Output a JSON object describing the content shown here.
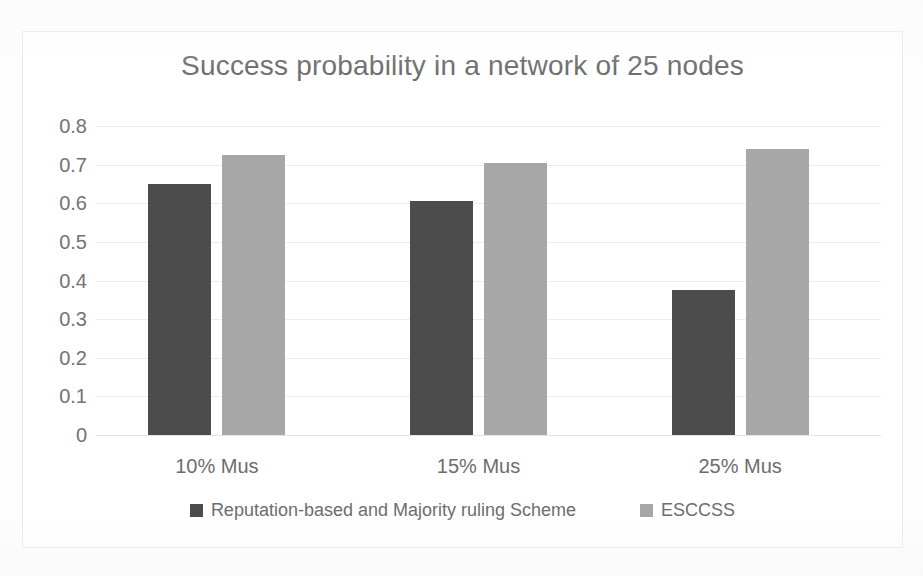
{
  "chart_data": {
    "type": "bar",
    "title": "Success probability in a network of 25 nodes",
    "xlabel": "",
    "ylabel": "",
    "categories": [
      "10% Mus",
      "15% Mus",
      "25% Mus"
    ],
    "series": [
      {
        "name": "Reputation-based and Majority ruling Scheme",
        "color": "#4c4c4c",
        "values": [
          0.65,
          0.605,
          0.375
        ]
      },
      {
        "name": "ESCCSS",
        "color": "#a7a7a7",
        "values": [
          0.725,
          0.705,
          0.74
        ]
      }
    ],
    "ylim": [
      0,
      0.8
    ],
    "yticks": [
      0,
      0.1,
      0.2,
      0.3,
      0.4,
      0.5,
      0.6,
      0.7,
      0.8
    ],
    "ytick_labels": [
      "0",
      "0.1",
      "0.2",
      "0.3",
      "0.4",
      "0.5",
      "0.6",
      "0.7",
      "0.8"
    ],
    "grid": true,
    "legend_position": "bottom"
  },
  "colors": {
    "series_dark": "#4c4c4c",
    "series_light": "#a7a7a7",
    "title_text": "#6f6f6f",
    "axis_text": "#6d6d6d",
    "gridline": "#ededed",
    "frame_border": "#e8e8e8",
    "background": "#ffffff"
  }
}
